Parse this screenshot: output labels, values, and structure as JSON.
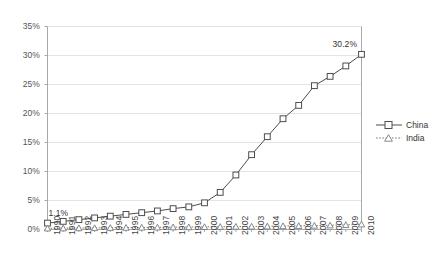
{
  "chart_data": {
    "type": "line",
    "title": "",
    "subtitle": "",
    "xlabel": "",
    "ylabel": "",
    "grid": "horizontal",
    "legend_position": "right",
    "xlim": [
      1990,
      2010
    ],
    "ylim": [
      0,
      35
    ],
    "ytick_labels": [
      "35%",
      "30%",
      "25%",
      "20%",
      "15%",
      "10%",
      "5%",
      "0%"
    ],
    "ytick_values": [
      35,
      30,
      25,
      20,
      15,
      10,
      5,
      0
    ],
    "categories": [
      "1990",
      "1991",
      "1992",
      "1993",
      "1994",
      "1995",
      "1996",
      "1997",
      "1998",
      "1999",
      "2000",
      "2001",
      "2002",
      "2003",
      "2004",
      "2005",
      "2006",
      "2007",
      "2008",
      "2009",
      "2010"
    ],
    "series": [
      {
        "name": "China",
        "marker": "square",
        "line_style": "solid",
        "color": "#4d4d4d",
        "values": [
          1.1,
          1.4,
          1.7,
          2.0,
          2.3,
          2.6,
          2.9,
          3.2,
          3.6,
          3.9,
          4.6,
          6.4,
          9.4,
          12.9,
          16.0,
          19.1,
          21.4,
          24.8,
          26.4,
          28.2,
          30.2
        ]
      },
      {
        "name": "India",
        "marker": "triangle",
        "line_style": "dotted",
        "color": "#7a7a7a",
        "values": [
          0.2,
          0.22,
          0.25,
          0.27,
          0.3,
          0.32,
          0.35,
          0.37,
          0.4,
          0.42,
          0.45,
          0.48,
          0.5,
          0.53,
          0.56,
          0.6,
          0.64,
          0.68,
          0.72,
          0.8,
          0.9
        ]
      }
    ],
    "annotations": [
      {
        "text": "1.1%",
        "series": "China",
        "category": "1990",
        "value": 1.1
      },
      {
        "text": "30.2%",
        "series": "China",
        "category": "2010",
        "value": 30.2
      }
    ]
  },
  "legend": {
    "items": [
      {
        "label": "China"
      },
      {
        "label": "India"
      }
    ]
  },
  "colors": {
    "china": "#4d4d4d",
    "india": "#7a7a7a",
    "gridline": "#e3e3e3",
    "axis": "#a8a8a8",
    "text": "#3a3a3a"
  }
}
